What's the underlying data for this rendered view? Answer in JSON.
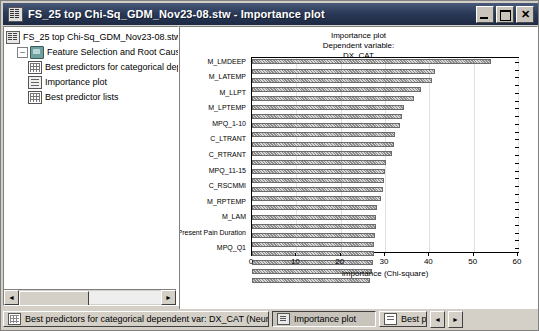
{
  "window": {
    "title": "FS_25 top Chi-Sq_GDM_Nov23-08.stw - Importance plot",
    "icon": "workbook-icon",
    "buttons": {
      "minimize": "minimize-button",
      "maximize": "maximize-button",
      "close_label": "✕"
    }
  },
  "tree": {
    "items": [
      {
        "label": "FS_25 top Chi-Sq_GDM_Nov23-08.stw",
        "icon": "workbook-icon",
        "indent": 0,
        "expander": ""
      },
      {
        "label": "Feature Selection and Root Cause An",
        "icon": "folder-icon",
        "indent": 1,
        "expander": "–"
      },
      {
        "label": "Best predictors for categorical dep",
        "icon": "spreadsheet-icon",
        "indent": 2,
        "expander": ""
      },
      {
        "label": "Importance plot",
        "icon": "plot-icon",
        "indent": 2,
        "expander": ""
      },
      {
        "label": "Best predictor lists",
        "icon": "spreadsheet-icon",
        "indent": 2,
        "expander": ""
      }
    ],
    "hscroll": {
      "left_arrow": "◄",
      "right_arrow": "►"
    }
  },
  "chart_data": {
    "type": "bar",
    "orientation": "horizontal",
    "title": "Importance plot",
    "subtitle": "Dependent variable:",
    "dependent_variable": "DX_CAT",
    "xlabel": "Importance (Chi-square)",
    "ylabel": "",
    "xlim": [
      0,
      60
    ],
    "xticks": [
      0,
      10,
      20,
      30,
      40,
      50,
      60
    ],
    "grid": true,
    "legend": false,
    "bar_fill": "#b0b0b0",
    "bar_edge": "#6b6b6b",
    "categories": [
      "M_LMDEEP",
      "",
      "M_LATEMP",
      "",
      "M_LLPT",
      "",
      "M_LPTEMP",
      "",
      "MPQ_1-10",
      "",
      "C_LTRANT",
      "",
      "C_RTRANT",
      "",
      "MPQ_11-15",
      "",
      "C_RSCMMI",
      "",
      "M_RPTEMP",
      "",
      "M_LAM",
      "",
      "Present Pain Duration",
      "",
      "MPQ_Q1"
    ],
    "labeled_categories": [
      "M_LMDEEP",
      "M_LATEMP",
      "M_LLPT",
      "M_LPTEMP",
      "MPQ_1-10",
      "C_LTRANT",
      "C_RTRANT",
      "MPQ_11-15",
      "C_RSCMMI",
      "M_RPTEMP",
      "M_LAM",
      "Present Pain Duration",
      "MPQ_Q1"
    ],
    "values": [
      54.0,
      41.2,
      40.5,
      38.2,
      36.5,
      34.3,
      33.8,
      33.3,
      32.2,
      32.0,
      31.6,
      30.3,
      30.0,
      29.8,
      29.6,
      29.2,
      28.1,
      28.0,
      27.9,
      27.8,
      27.6,
      27.5,
      27.3,
      27.0,
      26.7
    ]
  },
  "taskbar": {
    "buttons": [
      {
        "label": "Best predictors for categorical dependent var: DX_CAT (Neural...",
        "icon": "spreadsheet-icon",
        "active": false
      },
      {
        "label": "Importance plot",
        "icon": "plot-icon",
        "active": true
      },
      {
        "label": "Best p",
        "icon": "list-icon",
        "active": false
      }
    ],
    "nav": {
      "prev": "◄",
      "next": "►"
    }
  }
}
